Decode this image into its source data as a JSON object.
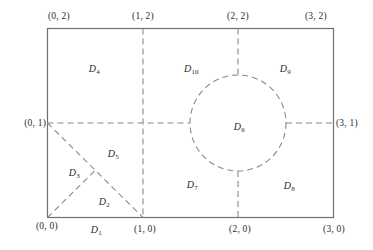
{
  "figure": {
    "type": "geometric-diagram",
    "stroke_color": "#6f6f6f",
    "dash_color": "#8a8a8a",
    "text_color": "#2b2b2b",
    "background": "#ffffff",
    "domain": {
      "x_min": 0,
      "x_max": 3,
      "y_min": 0,
      "y_max": 2
    },
    "circle": {
      "center_x": 2,
      "center_y": 1,
      "radius": 0.5
    }
  },
  "corner_labels": [
    {
      "name": "top-left",
      "text": "(0, 2)",
      "x": 0,
      "y": 2
    },
    {
      "name": "top-mid-1",
      "text": "(1, 2)",
      "x": 1,
      "y": 2
    },
    {
      "name": "top-mid-2",
      "text": "(2, 2)",
      "x": 2,
      "y": 2
    },
    {
      "name": "top-right",
      "text": "(3, 2)",
      "x": 3,
      "y": 2
    },
    {
      "name": "left-mid",
      "text": "(0, 1)",
      "x": 0,
      "y": 1
    },
    {
      "name": "right-mid",
      "text": "(3, 1)",
      "x": 3,
      "y": 1
    },
    {
      "name": "bottom-left",
      "text": "(0, 0)",
      "x": 0,
      "y": 0
    },
    {
      "name": "bottom-mid-1",
      "text": "(1, 0)",
      "x": 1,
      "y": 0
    },
    {
      "name": "bottom-mid-2",
      "text": "(2, 0)",
      "x": 2,
      "y": 0
    },
    {
      "name": "bottom-right",
      "text": "(3, 0)",
      "x": 3,
      "y": 0
    }
  ],
  "region_labels": [
    {
      "name": "D1",
      "base": "D",
      "sub": "1"
    },
    {
      "name": "D2",
      "base": "D",
      "sub": "2"
    },
    {
      "name": "D3",
      "base": "D",
      "sub": "3"
    },
    {
      "name": "D4",
      "base": "D",
      "sub": "4"
    },
    {
      "name": "D5",
      "base": "D",
      "sub": "5"
    },
    {
      "name": "D6",
      "base": "D",
      "sub": "6"
    },
    {
      "name": "D7",
      "base": "D",
      "sub": "7"
    },
    {
      "name": "D8",
      "base": "D",
      "sub": "8"
    },
    {
      "name": "D9",
      "base": "D",
      "sub": "9"
    },
    {
      "name": "D10",
      "base": "D",
      "sub": "10"
    }
  ]
}
